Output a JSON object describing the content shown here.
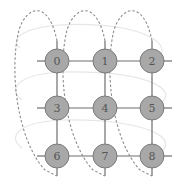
{
  "diagram": {
    "type": "torus-grid",
    "rows": 3,
    "cols": 3,
    "colors": {
      "node_fill": "#a8a8a8",
      "node_stroke": "#7a7a7a",
      "edge": "#6e6e6e",
      "wrap_vertical": "#8c8c8c",
      "wrap_horizontal": "#e4e4e4",
      "label": "#555555"
    },
    "nodes": [
      {
        "id": "0",
        "label": "0",
        "x": 57,
        "y": 61
      },
      {
        "id": "1",
        "label": "1",
        "x": 105,
        "y": 61
      },
      {
        "id": "2",
        "label": "2",
        "x": 152,
        "y": 61
      },
      {
        "id": "3",
        "label": "3",
        "x": 57,
        "y": 108
      },
      {
        "id": "4",
        "label": "4",
        "x": 105,
        "y": 108
      },
      {
        "id": "5",
        "label": "5",
        "x": 152,
        "y": 108
      },
      {
        "id": "6",
        "label": "6",
        "x": 57,
        "y": 156
      },
      {
        "id": "7",
        "label": "7",
        "x": 105,
        "y": 156
      },
      {
        "id": "8",
        "label": "8",
        "x": 152,
        "y": 156
      }
    ],
    "edges": [
      [
        "0",
        "1"
      ],
      [
        "1",
        "2"
      ],
      [
        "3",
        "4"
      ],
      [
        "4",
        "5"
      ],
      [
        "6",
        "7"
      ],
      [
        "7",
        "8"
      ],
      [
        "0",
        "3"
      ],
      [
        "3",
        "6"
      ],
      [
        "1",
        "4"
      ],
      [
        "4",
        "7"
      ],
      [
        "2",
        "5"
      ],
      [
        "5",
        "8"
      ]
    ],
    "wraparound_vertical": [
      [
        "0",
        "6"
      ],
      [
        "1",
        "7"
      ],
      [
        "2",
        "8"
      ]
    ],
    "wraparound_horizontal": [
      [
        "0",
        "2"
      ],
      [
        "3",
        "5"
      ],
      [
        "6",
        "8"
      ]
    ]
  }
}
